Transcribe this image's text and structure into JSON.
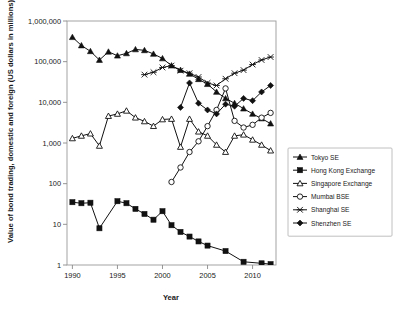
{
  "chart_data": {
    "type": "line",
    "title": "",
    "xlabel": "Year",
    "ylabel": "Value of bond trading, domestic and foreign (US dollars in millions)",
    "xlim": [
      1989.4,
      2012.6
    ],
    "ylim": [
      1,
      1000000
    ],
    "yscale": "log",
    "grid": false,
    "legend_position": "right",
    "xticks": [
      1990,
      1995,
      2000,
      2005,
      2010
    ],
    "xtick_labels": [
      "1990",
      "1995",
      "2000",
      "2005",
      "2010"
    ],
    "yticks": [
      1,
      10,
      100,
      1000,
      10000,
      100000,
      1000000
    ],
    "ytick_labels": [
      "1",
      "10",
      "100",
      "1,000",
      "10,000",
      "100,000",
      "1,000,000"
    ],
    "series": [
      {
        "name": "Tokyo SE",
        "marker": "filled-triangle",
        "x": [
          1990,
          1991,
          1992,
          1993,
          1994,
          1995,
          1996,
          1997,
          1998,
          1999,
          2000,
          2001,
          2002,
          2003,
          2004,
          2005,
          2006,
          2007,
          2008,
          2009,
          2010,
          2011,
          2012
        ],
        "values": [
          400000,
          250000,
          180000,
          110000,
          175000,
          140000,
          160000,
          200000,
          190000,
          155000,
          120000,
          80000,
          62000,
          50000,
          37000,
          28000,
          18000,
          12500,
          9500,
          7000,
          5200,
          4000,
          3000
        ]
      },
      {
        "name": "Hong Kong Exchange",
        "marker": "filled-square",
        "x": [
          1990,
          1991,
          1992,
          1993,
          1995,
          1996,
          1997,
          1998,
          1999,
          2000,
          2001,
          2002,
          2003,
          2004,
          2005,
          2007,
          2009,
          2011,
          2012
        ],
        "values": [
          35,
          33,
          34,
          8,
          37,
          33,
          24,
          18,
          13,
          21,
          9.5,
          6.5,
          5,
          3.8,
          3,
          2.2,
          1.2,
          1.1,
          1.05
        ]
      },
      {
        "name": "Singapore Exchange",
        "marker": "open-triangle",
        "x": [
          1990,
          1991,
          1992,
          1993,
          1994,
          1995,
          1996,
          1997,
          1998,
          1999,
          2000,
          2001,
          2002,
          2003,
          2004,
          2005,
          2006,
          2007,
          2008,
          2009,
          2010,
          2011,
          2012
        ],
        "values": [
          1300,
          1500,
          1700,
          850,
          4600,
          5200,
          6200,
          4200,
          3400,
          2600,
          3800,
          3900,
          800,
          3900,
          1900,
          1500,
          900,
          600,
          1500,
          1600,
          1200,
          900,
          650
        ]
      },
      {
        "name": "Mumbai BSE",
        "marker": "open-circle",
        "x": [
          2001,
          2002,
          2003,
          2004,
          2005,
          2006,
          2007,
          2008,
          2009,
          2010,
          2011,
          2012
        ],
        "values": [
          110,
          250,
          600,
          1100,
          2600,
          6500,
          22000,
          3500,
          2400,
          2800,
          4200,
          5500
        ]
      },
      {
        "name": "Shanghai SE",
        "marker": "cross",
        "x": [
          1998,
          1999,
          2000,
          2001,
          2002,
          2003,
          2004,
          2005,
          2006,
          2007,
          2008,
          2009,
          2010,
          2011,
          2012
        ],
        "values": [
          48000,
          55000,
          72000,
          80000,
          60000,
          52000,
          42000,
          30000,
          26000,
          38000,
          52000,
          62000,
          85000,
          110000,
          130000
        ]
      },
      {
        "name": "Shenzhen SE",
        "marker": "filled-diamond",
        "x": [
          2002,
          2003,
          2004,
          2005,
          2006,
          2007,
          2008,
          2009,
          2010,
          2011,
          2012
        ],
        "values": [
          7500,
          30000,
          9500,
          6500,
          5200,
          9000,
          8000,
          12500,
          11000,
          18000,
          26000
        ]
      }
    ]
  },
  "axes": {
    "y_title": "Value of bond trading, domestic and foreign (US dollars in millions)",
    "x_title": "Year"
  },
  "legend": {
    "items": [
      {
        "label": "Tokyo SE",
        "marker": "filled-triangle"
      },
      {
        "label": "Hong Kong Exchange",
        "marker": "filled-square"
      },
      {
        "label": "Singapore Exchange",
        "marker": "open-triangle"
      },
      {
        "label": "Mumbai BSE",
        "marker": "open-circle"
      },
      {
        "label": "Shanghai SE",
        "marker": "cross"
      },
      {
        "label": "Shenzhen SE",
        "marker": "filled-diamond"
      }
    ]
  },
  "colors": {
    "series": "#111111",
    "frame": "#9a9a9a",
    "background": "#ffffff"
  }
}
